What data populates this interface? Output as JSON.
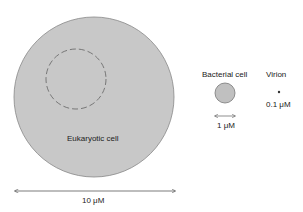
{
  "diagram": {
    "eukaryotic": {
      "label": "Eukaryotic cell",
      "scale": "10 μM"
    },
    "bacterial": {
      "label": "Bacterial cell",
      "scale": "1 μM"
    },
    "virion": {
      "label": "Virion",
      "scale": "0.1 μM"
    },
    "colors": {
      "cell_fill": "#c8c8c8",
      "cell_stroke": "#777777",
      "line": "#333333"
    }
  }
}
